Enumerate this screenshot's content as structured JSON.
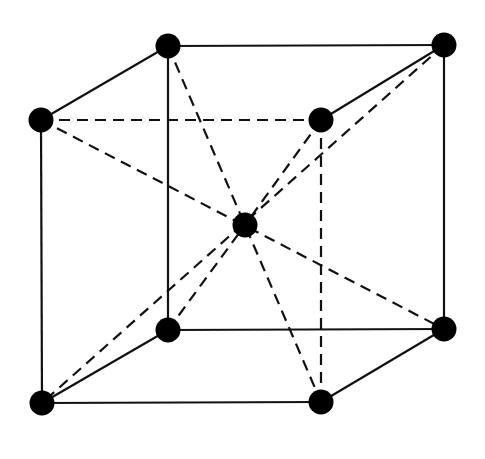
{
  "diagram": {
    "colors": {
      "line": "#111111",
      "atom": "#000000",
      "background": "#ffffff"
    },
    "atoms": [
      {
        "id": "back-top-left",
        "x": 168,
        "y": 46
      },
      {
        "id": "back-top-right",
        "x": 444,
        "y": 45
      },
      {
        "id": "front-top-left",
        "x": 41,
        "y": 120
      },
      {
        "id": "front-top-right",
        "x": 321,
        "y": 120
      },
      {
        "id": "body-center",
        "x": 245,
        "y": 225
      },
      {
        "id": "back-bottom-left",
        "x": 168,
        "y": 330
      },
      {
        "id": "back-bottom-right",
        "x": 444,
        "y": 329
      },
      {
        "id": "front-bottom-left",
        "x": 42,
        "y": 403
      },
      {
        "id": "front-bottom-right",
        "x": 321,
        "y": 402
      }
    ],
    "solid_edges": [
      [
        168,
        46,
        444,
        45
      ],
      [
        168,
        46,
        41,
        120
      ],
      [
        321,
        120,
        444,
        45
      ],
      [
        41,
        120,
        42,
        403
      ],
      [
        168,
        46,
        168,
        330
      ],
      [
        444,
        45,
        444,
        329
      ],
      [
        168,
        330,
        444,
        329
      ],
      [
        42,
        403,
        321,
        402
      ],
      [
        42,
        403,
        168,
        330
      ],
      [
        321,
        402,
        444,
        329
      ]
    ],
    "dashed_edges": [
      [
        41,
        120,
        321,
        120
      ],
      [
        321,
        120,
        321,
        402
      ],
      [
        41,
        120,
        444,
        329
      ],
      [
        168,
        46,
        321,
        402
      ],
      [
        444,
        45,
        42,
        403
      ],
      [
        321,
        120,
        245,
        225
      ],
      [
        168,
        330,
        245,
        225
      ]
    ]
  }
}
